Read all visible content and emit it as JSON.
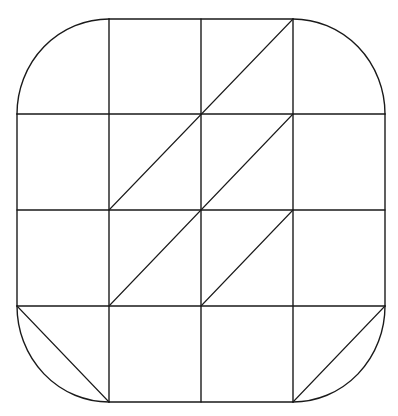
{
  "diagram": {
    "type": "rounded-square-grid",
    "stroke_color": "#1a1a1a",
    "background_color": "#ffffff",
    "grid": {
      "rows": 4,
      "cols": 4,
      "x_lines": [
        17,
        109,
        201,
        293,
        385
      ],
      "y_lines": [
        19,
        114,
        210,
        306,
        402
      ]
    },
    "horizontal_lines": [
      {
        "y": 19,
        "x1": 109,
        "x2": 293
      },
      {
        "y": 114,
        "x1": 17,
        "x2": 385
      },
      {
        "y": 210,
        "x1": 17,
        "x2": 385
      },
      {
        "y": 306,
        "x1": 17,
        "x2": 385
      },
      {
        "y": 402,
        "x1": 109,
        "x2": 293
      }
    ],
    "vertical_lines": [
      {
        "x": 17,
        "y1": 114,
        "y2": 306
      },
      {
        "x": 109,
        "y1": 19,
        "y2": 402
      },
      {
        "x": 201,
        "y1": 19,
        "y2": 402
      },
      {
        "x": 293,
        "y1": 19,
        "y2": 402
      },
      {
        "x": 385,
        "y1": 114,
        "y2": 306
      }
    ],
    "corner_arcs": [
      {
        "name": "top-left",
        "from": [
          17,
          114
        ],
        "to": [
          109,
          19
        ],
        "center": [
          109,
          114
        ]
      },
      {
        "name": "top-right",
        "from": [
          293,
          19
        ],
        "to": [
          385,
          114
        ],
        "center": [
          293,
          114
        ]
      },
      {
        "name": "bottom-left",
        "from": [
          17,
          306
        ],
        "to": [
          109,
          402
        ],
        "center": [
          109,
          306
        ]
      },
      {
        "name": "bottom-right",
        "from": [
          293,
          402
        ],
        "to": [
          385,
          306
        ],
        "center": [
          293,
          306
        ]
      }
    ],
    "diagonals": [
      {
        "from": [
          109,
          210
        ],
        "to": [
          293,
          19
        ]
      },
      {
        "from": [
          109,
          306
        ],
        "to": [
          293,
          114
        ]
      },
      {
        "from": [
          201,
          306
        ],
        "to": [
          293,
          210
        ]
      },
      {
        "from": [
          17,
          306
        ],
        "to": [
          109,
          402
        ]
      },
      {
        "from": [
          293,
          402
        ],
        "to": [
          385,
          306
        ]
      }
    ]
  }
}
